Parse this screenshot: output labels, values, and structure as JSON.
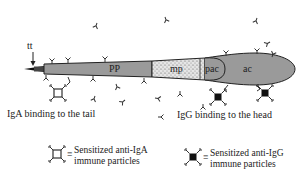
{
  "diagram": {
    "labels": {
      "tail_tip": "tt",
      "principal_piece": "PP",
      "midpiece": "mp",
      "post_acrosomal": "pac",
      "acrosome": "ac"
    },
    "captions": {
      "left": "IgA binding to the tail",
      "right": "IgG binding to the head"
    },
    "legend": [
      {
        "symbol": "open-ring-particle-icon",
        "equiv": "≡",
        "line1": "Sensitized anti-IgA",
        "line2": "immune particles"
      },
      {
        "symbol": "filled-dot-particle-icon",
        "equiv": "≡",
        "line1": "Sensitized anti-IgG",
        "line2": "immune particles"
      }
    ],
    "colors": {
      "body_fill": "#9a9a9a",
      "outline": "#222222",
      "midpiece_fill": "#d8d8d8"
    }
  }
}
